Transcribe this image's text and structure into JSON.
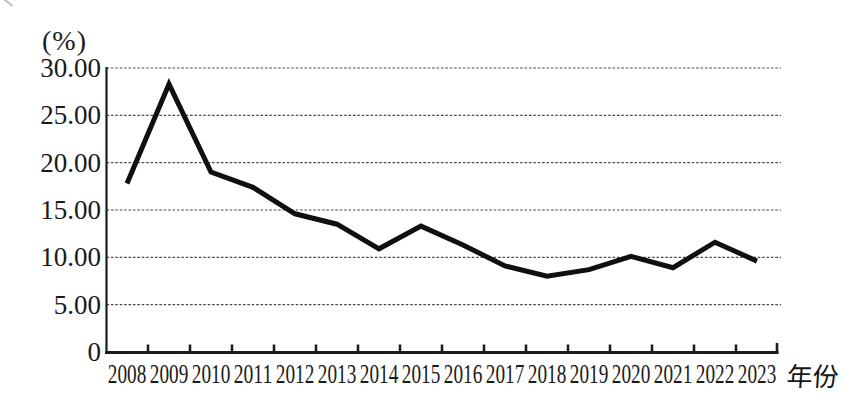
{
  "figure": {
    "y_axis_unit": "(%)",
    "x_axis_title": "年份"
  },
  "chart_data": {
    "type": "line",
    "title": "",
    "xlabel": "年份",
    "ylabel": "(%)",
    "categories": [
      "2008",
      "2009",
      "2010",
      "2011",
      "2012",
      "2013",
      "2014",
      "2015",
      "2016",
      "2017",
      "2018",
      "2019",
      "2020",
      "2021",
      "2022",
      "2023"
    ],
    "values": [
      17.8,
      28.3,
      19.0,
      17.4,
      14.6,
      13.5,
      10.9,
      13.3,
      11.3,
      9.1,
      8.0,
      8.7,
      10.1,
      8.9,
      11.6,
      9.6
    ],
    "ylim": [
      0,
      30
    ],
    "y_ticks": [
      {
        "value": 0,
        "label": "0"
      },
      {
        "value": 5,
        "label": "5.00"
      },
      {
        "value": 10,
        "label": "10.00"
      },
      {
        "value": 15,
        "label": "15.00"
      },
      {
        "value": 20,
        "label": "20.00"
      },
      {
        "value": 25,
        "label": "25.00"
      },
      {
        "value": 30,
        "label": "30.00"
      }
    ],
    "grid": "horizontal-dashed",
    "legend": "none",
    "series_count": 1,
    "line_color": "#101010",
    "axis_color": "#1c1c1c",
    "gridline_color": "#4d4d4d"
  }
}
